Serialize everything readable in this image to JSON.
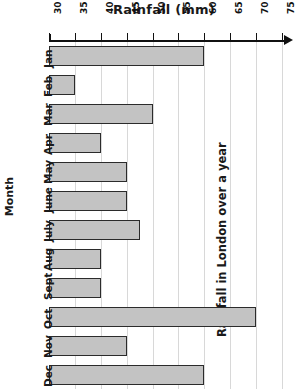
{
  "chart_data": {
    "type": "bar",
    "orientation": "horizontal",
    "title": "Rainfall in London over a year",
    "xlabel": "Rainfall (mm)",
    "ylabel": "Month",
    "categories": [
      "Jan",
      "Feb",
      "Mar",
      "Apr",
      "May",
      "June",
      "July",
      "Aug",
      "Sept",
      "Oct",
      "Nov",
      "Dec"
    ],
    "values": [
      60,
      35,
      50,
      40,
      45,
      45,
      47.5,
      40,
      40,
      70,
      45,
      60
    ],
    "xlim": [
      30,
      75
    ],
    "xticks": [
      30,
      35,
      40,
      45,
      50,
      55,
      60,
      65,
      70,
      75
    ],
    "xtick_labels": [
      "30",
      "35",
      "40",
      "45",
      "50",
      "55",
      "60",
      "65",
      "70",
      "75"
    ],
    "grid": "vertical",
    "legend": "none",
    "bar_fill_color": "#c3c3c3",
    "bar_edge_color": "#2b2b2b",
    "gridline_color": "#d8d8d8",
    "axis_color": "#111111"
  }
}
